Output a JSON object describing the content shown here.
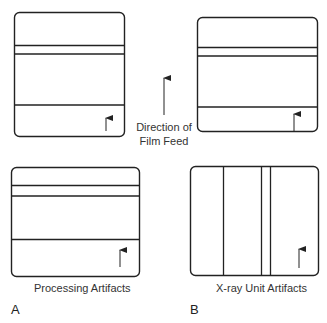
{
  "figure": {
    "center": {
      "label_line1": "Direction of",
      "label_line2": "Film Feed"
    },
    "panel_a": {
      "letter": "A",
      "caption": "Processing Artifacts"
    },
    "panel_b": {
      "letter": "B",
      "caption": "X-ray Unit Artifacts"
    },
    "colors": {
      "stroke": "#222222",
      "background": "#ffffff"
    }
  }
}
